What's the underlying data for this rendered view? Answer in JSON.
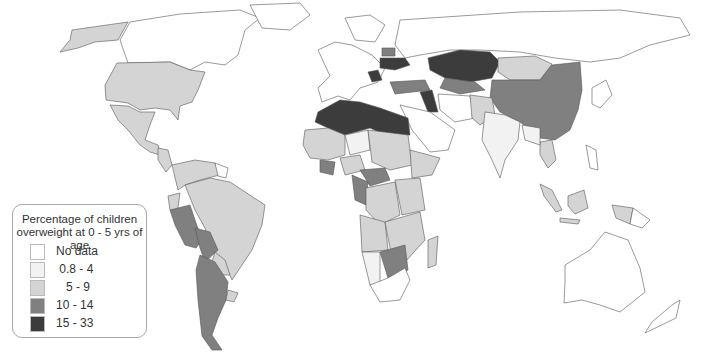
{
  "legend": {
    "title_line1": "Percentage of children",
    "title_line2": "overweight at 0 - 5 yrs of age",
    "classes": [
      {
        "label": "No data",
        "color": "#ffffff"
      },
      {
        "label": " 0.8 - 4",
        "color": "#f2f2f2"
      },
      {
        "label": "   5 - 9",
        "color": "#d4d4d4"
      },
      {
        "label": "10 - 14",
        "color": "#808080"
      },
      {
        "label": "15 - 33",
        "color": "#3c3c3c"
      }
    ]
  },
  "map": {
    "type": "choropleth",
    "projection": "world",
    "colors": {
      "no_data": "#ffffff",
      "c1": "#f2f2f2",
      "c2": "#d4d4d4",
      "c3": "#808080",
      "c4": "#3c3c3c",
      "border": "#555555"
    }
  }
}
